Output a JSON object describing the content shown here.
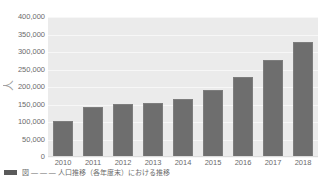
{
  "chart_data": {
    "type": "bar",
    "title": "",
    "subtitle": "",
    "xlabel": "",
    "ylabel": "人",
    "categories": [
      "2010",
      "2011",
      "2012",
      "2013",
      "2014",
      "2015",
      "2016",
      "2017",
      "2018"
    ],
    "values": [
      102000,
      143000,
      152000,
      155000,
      167000,
      192000,
      230000,
      276000,
      330000
    ],
    "series": [
      {
        "name": "",
        "values": [
          102000,
          143000,
          152000,
          155000,
          167000,
          192000,
          230000,
          276000,
          330000
        ]
      }
    ],
    "ylim": [
      0,
      400000
    ],
    "yticks": [
      0,
      50000,
      100000,
      150000,
      200000,
      250000,
      300000,
      350000,
      400000
    ],
    "ytick_labels": [
      "0",
      "50,000",
      "100,000",
      "150,000",
      "200,000",
      "250,000",
      "300,000",
      "350,000",
      "400,000"
    ],
    "grid": true,
    "legend": "none",
    "bar_color": "#6e6e6e",
    "plot_background": "#ebebeb",
    "figure_background": "#ffffff"
  },
  "axis": {
    "y_title": "人"
  },
  "caption": {
    "marker": "",
    "text": "図 ― ― ― 人口推移（各年度末）における推移"
  }
}
